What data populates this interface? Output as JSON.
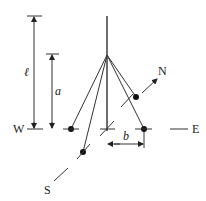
{
  "diagram": {
    "labels": {
      "length": "ℓ",
      "a": "a",
      "b": "b",
      "west": "W",
      "east": "E",
      "north": "N",
      "south": "S"
    },
    "colors": {
      "ink": "#222222",
      "background": "#ffffff"
    }
  }
}
